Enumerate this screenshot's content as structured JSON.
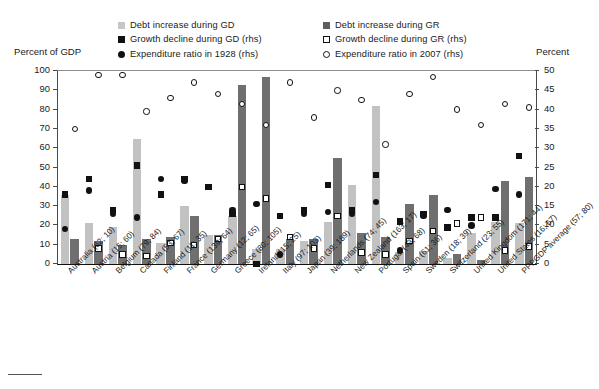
{
  "axes": {
    "left_title": "Percent of GDP",
    "right_title": "Percent",
    "left_ticks": [
      0,
      10,
      20,
      30,
      40,
      50,
      60,
      70,
      80,
      90,
      100
    ],
    "right_ticks": [
      0,
      5,
      10,
      15,
      20,
      25,
      30,
      35,
      40,
      45,
      50
    ]
  },
  "legend": {
    "column1": [
      {
        "marker": "square-light-gray",
        "label": "Debt increase during GD"
      },
      {
        "marker": "square-black",
        "label": "Growth decline during GD (rhs)"
      },
      {
        "marker": "circle-filled-black",
        "label": "Expenditure ratio in 1928 (rhs)"
      }
    ],
    "column2": [
      {
        "marker": "square-dark-gray",
        "label": "Debt increase during GR"
      },
      {
        "marker": "square-open",
        "label": "Growth decline during GR (rhs)"
      },
      {
        "marker": "circle-open",
        "label": "Expenditure ratio in 2007 (rhs)"
      }
    ]
  },
  "chart_data": {
    "type": "bar",
    "title": "",
    "xlabel": "",
    "ylabel": "Percent of GDP",
    "ylabel_right": "Percent",
    "ylim": [
      0,
      100
    ],
    "ylim_right": [
      0,
      50
    ],
    "grid": false,
    "legend_position": "top",
    "categories": [
      "Australia (62; 10)",
      "Austria (15; 60)",
      "Belgium (79; 84)",
      "Canada (53; 67)",
      "Finland (11; 35)",
      "France (139; 64)",
      "Germany (12; 65)",
      "Greece (80; 105)",
      "Ireland (15; 25)",
      "Italy (97; 103)",
      "Japan (39; 189)",
      "Netherlands (74; 45)",
      "New Zealand (163; 17)",
      "Portugal (43; 68)",
      "Spain (61; 36)",
      "Sweden (18; 39)",
      "Switzerland (23; 55)",
      "United Kingdom (171; 44)",
      "United States (16; 67)",
      "PPPGDP average (57; 80)"
    ],
    "series": [
      {
        "name": "Debt increase during GD",
        "axis": "left",
        "type": "bar",
        "values": [
          36,
          21,
          19,
          65,
          11,
          30,
          15,
          25,
          8,
          8,
          12,
          22,
          41,
          82,
          6,
          7,
          3,
          16,
          22,
          21
        ]
      },
      {
        "name": "Debt increase during GR",
        "axis": "left",
        "type": "bar",
        "values": [
          13,
          12,
          10,
          13,
          14,
          25,
          15,
          93,
          97,
          13,
          13,
          55,
          16,
          14,
          31,
          36,
          5,
          2,
          43,
          45
        ]
      },
      {
        "name": "Growth decline during GD (rhs)",
        "axis": "right",
        "type": "scatter",
        "values": [
          18,
          22,
          14,
          25.5,
          18,
          22,
          20,
          13,
          0,
          12.5,
          14,
          20.5,
          14,
          23,
          11,
          13,
          9.5,
          12,
          12,
          28
        ]
      },
      {
        "name": "Growth decline during GR (rhs)",
        "axis": "right",
        "type": "scatter",
        "values": [
          null,
          4,
          2.5,
          2,
          5.5,
          5,
          6.5,
          20,
          17,
          7,
          4,
          12.5,
          3,
          2.5,
          6,
          8.5,
          10.5,
          12,
          3.5,
          4.5
        ]
      },
      {
        "name": "Expenditure ratio in 1928 (rhs)",
        "axis": "right",
        "type": "scatter",
        "values": [
          9,
          19,
          13,
          12,
          22,
          21.5,
          null,
          14,
          15.5,
          2.5,
          13,
          13.5,
          13,
          16,
          3.5,
          12.5,
          14,
          10,
          19.5,
          18
        ]
      },
      {
        "name": "Expenditure ratio in 2007 (rhs)",
        "axis": "right",
        "type": "scatter",
        "values": [
          35,
          49,
          49,
          39.5,
          43,
          47,
          44,
          41.5,
          36,
          47,
          38,
          45,
          42.5,
          31,
          44,
          48.5,
          40,
          36,
          41.5,
          40.5
        ]
      }
    ]
  }
}
